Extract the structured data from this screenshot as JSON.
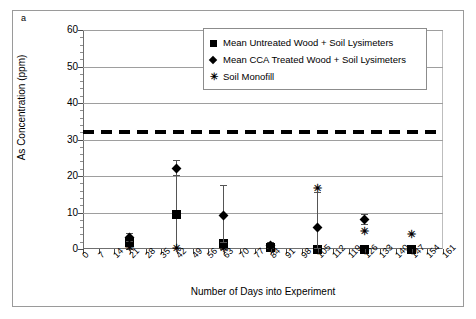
{
  "panel_letter": "a",
  "chart_data": {
    "type": "scatter",
    "title": "",
    "xlabel": "Number of Days into Experiment",
    "ylabel": "As Concentration (ppm)",
    "ylim": [
      0,
      60
    ],
    "ytick_labels": [
      "0",
      "10",
      "20",
      "30",
      "40",
      "50",
      "60"
    ],
    "ytick_values": [
      0,
      10,
      20,
      30,
      40,
      50,
      60
    ],
    "y_minor_step": 2,
    "xlim": [
      0,
      161
    ],
    "xtick_labels": [
      "0",
      "7",
      "14",
      "21",
      "28",
      "35",
      "42",
      "49",
      "56",
      "63",
      "70",
      "77",
      "84",
      "91",
      "98",
      "105",
      "112",
      "119",
      "126",
      "133",
      "140",
      "147",
      "154",
      "161"
    ],
    "xtick_values": [
      0,
      7,
      14,
      21,
      28,
      35,
      42,
      49,
      56,
      63,
      70,
      77,
      84,
      91,
      98,
      105,
      112,
      119,
      126,
      133,
      140,
      147,
      154,
      161
    ],
    "grid": "horizontal",
    "legend_position": "top-right",
    "threshold_line": {
      "label": "",
      "value": 32,
      "style": "dashed",
      "color": "#000000"
    },
    "series": [
      {
        "name": "Mean Untreated Wood + Soil Lysimeters",
        "marker": "square",
        "color": "#000000",
        "points": [
          {
            "x": 21,
            "y": 1.8,
            "err_low": 0.0,
            "err_high": 3.4
          },
          {
            "x": 42,
            "y": 9.4,
            "err_low": 0.2,
            "err_high": 22.5
          },
          {
            "x": 63,
            "y": 1.5,
            "err_low": 0.0,
            "err_high": 2.8
          },
          {
            "x": 84,
            "y": 0.4,
            "err_low": 0.0,
            "err_high": 1.4
          },
          {
            "x": 105,
            "y": 0.0,
            "err_low": 0.0,
            "err_high": 0.0
          },
          {
            "x": 126,
            "y": 0.0,
            "err_low": 0.0,
            "err_high": 0.0
          },
          {
            "x": 147,
            "y": 0.0,
            "err_low": 0.0,
            "err_high": 0.0
          }
        ]
      },
      {
        "name": "Mean CCA Treated Wood + Soil Lysimeters",
        "marker": "diamond",
        "color": "#000000",
        "points": [
          {
            "x": 21,
            "y": 3.2,
            "err_low": 2.1,
            "err_high": 4.3
          },
          {
            "x": 42,
            "y": 22.0,
            "err_low": 20.2,
            "err_high": 24.3
          },
          {
            "x": 63,
            "y": 9.2,
            "err_low": 2.0,
            "err_high": 17.5
          },
          {
            "x": 84,
            "y": 1.0,
            "err_low": 0.2,
            "err_high": 1.9
          },
          {
            "x": 105,
            "y": 6.0,
            "err_low": 0.2,
            "err_high": 15.6
          },
          {
            "x": 126,
            "y": 8.2,
            "err_low": 6.9,
            "err_high": 9.6
          },
          {
            "x": 147,
            "y": null,
            "err_low": null,
            "err_high": null
          }
        ]
      },
      {
        "name": "Soil Monofill",
        "marker": "cross",
        "color": "#000000",
        "points": [
          {
            "x": 21,
            "y": 0.6
          },
          {
            "x": 42,
            "y": 0.2
          },
          {
            "x": 63,
            "y": 0.4
          },
          {
            "x": 84,
            "y": 0.2
          },
          {
            "x": 105,
            "y": 16.7
          },
          {
            "x": 126,
            "y": 4.8
          },
          {
            "x": 147,
            "y": 4.2
          }
        ]
      }
    ]
  },
  "legend": {
    "items": [
      {
        "symbol": "square-marker-icon",
        "glyph": "",
        "label": "Mean Untreated Wood + Soil Lysimeters"
      },
      {
        "symbol": "diamond-marker-icon",
        "glyph": "",
        "label": "Mean CCA Treated Wood + Soil Lysimeters"
      },
      {
        "symbol": "cross-marker-icon",
        "glyph": "✳",
        "label": "Soil Monofill"
      }
    ]
  }
}
